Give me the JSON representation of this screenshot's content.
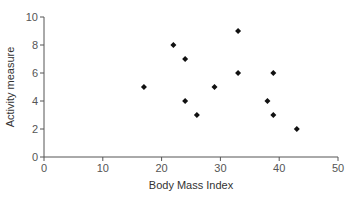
{
  "chart_data": {
    "type": "scatter",
    "title": "",
    "xlabel": "Body Mass Index",
    "ylabel": "Activity measure",
    "xlim": [
      0,
      50
    ],
    "ylim": [
      0,
      10
    ],
    "xticks": [
      0,
      10,
      20,
      30,
      40,
      50
    ],
    "yticks": [
      0,
      2,
      4,
      6,
      8,
      10
    ],
    "grid": false,
    "legend": null,
    "marker": "diamond",
    "marker_color": "#111111",
    "axis_color": "#555555",
    "points": [
      {
        "x": 17,
        "y": 5
      },
      {
        "x": 22,
        "y": 8
      },
      {
        "x": 24,
        "y": 7
      },
      {
        "x": 24,
        "y": 4
      },
      {
        "x": 26,
        "y": 3
      },
      {
        "x": 29,
        "y": 5
      },
      {
        "x": 33,
        "y": 9
      },
      {
        "x": 33,
        "y": 6
      },
      {
        "x": 38,
        "y": 4
      },
      {
        "x": 39,
        "y": 6
      },
      {
        "x": 39,
        "y": 3
      },
      {
        "x": 43,
        "y": 2
      }
    ]
  }
}
